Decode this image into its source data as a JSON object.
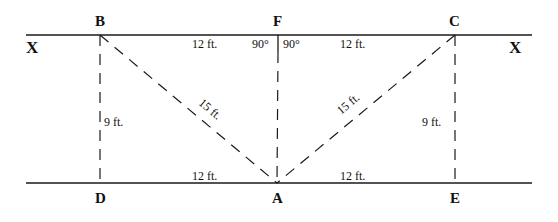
{
  "diagram": {
    "points": {
      "B": "B",
      "F": "F",
      "C": "C",
      "D": "D",
      "A": "A",
      "E": "E"
    },
    "line_labels": {
      "left": "X",
      "right": "X"
    },
    "measurements": {
      "BF": "12 ft.",
      "FC": "12 ft.",
      "DA": "12 ft.",
      "AE": "12 ft.",
      "BD": "9 ft.",
      "CE": "9 ft.",
      "BA": "15 ft.",
      "CA": "15 ft."
    },
    "angles": {
      "left_of_F": "90°",
      "right_of_F": "90°"
    }
  }
}
